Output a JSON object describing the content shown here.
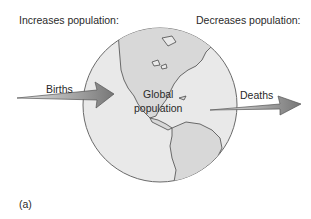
{
  "labels": {
    "increases": "Increases population:",
    "decreases": "Decreases population:",
    "births": "Births",
    "deaths": "Deaths",
    "global_line1": "Global",
    "global_line2": "population",
    "panel": "(a)"
  },
  "colors": {
    "globe_fill": "#e8e8e8",
    "globe_stroke": "#6a6a6a",
    "land_fill": "#d6d6d6",
    "land_stroke": "#4a4a4a",
    "arrow_light": "#e2e2e2",
    "arrow_dark": "#7a7a7a",
    "text": "#2a2a2a"
  },
  "icons": {
    "globe": "globe-americas-icon",
    "births_arrow": "arrow-right-icon",
    "deaths_arrow": "arrow-right-icon"
  }
}
